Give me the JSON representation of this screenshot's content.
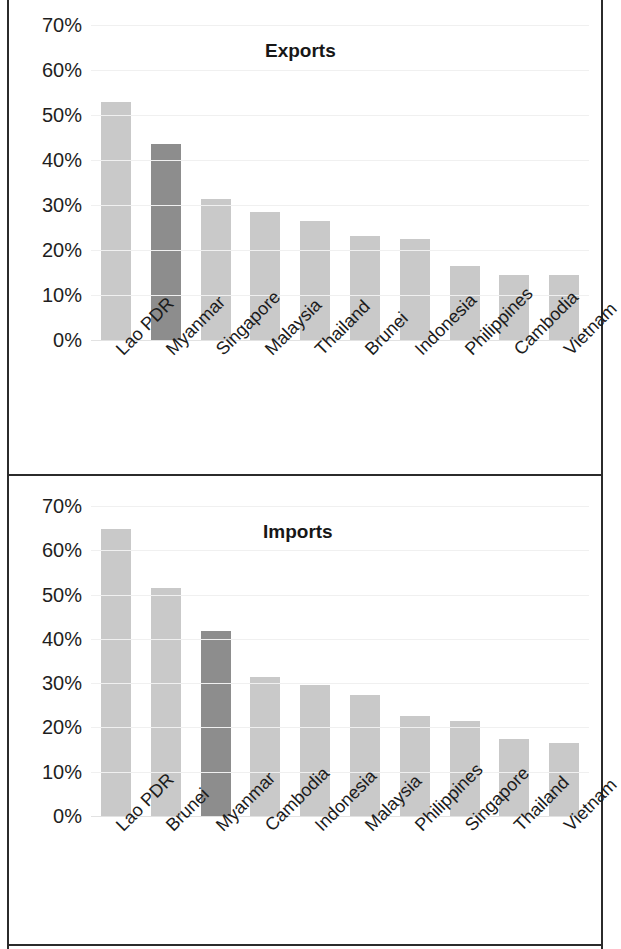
{
  "colors": {
    "bar_default": "#c9c9c9",
    "bar_highlight": "#8d8d8d",
    "frame": "#2b2b2b",
    "text": "#1b1b1b",
    "gridline": "#f0f0f0",
    "background": "#ffffff"
  },
  "panels": {
    "exports": {
      "title": "Exports"
    },
    "imports": {
      "title": "Imports"
    }
  },
  "axis": {
    "ticks": [
      "70%",
      "60%",
      "50%",
      "40%",
      "30%",
      "20%",
      "10%",
      "0%"
    ],
    "tick_values": [
      70,
      60,
      50,
      40,
      30,
      20,
      10,
      0
    ]
  },
  "chart_data": [
    {
      "type": "bar",
      "title": "Exports",
      "xlabel": "",
      "ylabel": "",
      "ylim": [
        0,
        70
      ],
      "ytick_labels": [
        "0%",
        "10%",
        "20%",
        "30%",
        "40%",
        "50%",
        "60%",
        "70%"
      ],
      "grid": true,
      "legend": "none",
      "highlight_category": "Myanmar",
      "categories": [
        "Lao PDR",
        "Myanmar",
        "Singapore",
        "Malaysia",
        "Thailand",
        "Brunei",
        "Indonesia",
        "Philippines",
        "Cambodia",
        "Vietnam"
      ],
      "values": [
        53.0,
        43.5,
        31.3,
        28.4,
        26.4,
        23.2,
        22.5,
        16.4,
        14.5,
        14.4
      ],
      "value_labels": [
        "53%",
        "43.5%",
        "31.3%",
        "28.4%",
        "26.4%",
        "23.2%",
        "22.5%",
        "16.4%",
        "14.5%",
        "14.4%"
      ]
    },
    {
      "type": "bar",
      "title": "Imports",
      "xlabel": "",
      "ylabel": "",
      "ylim": [
        0,
        70
      ],
      "ytick_labels": [
        "0%",
        "10%",
        "20%",
        "30%",
        "40%",
        "50%",
        "60%",
        "70%"
      ],
      "grid": true,
      "legend": "none",
      "highlight_category": "Myanmar",
      "categories": [
        "Lao PDR",
        "Brunei",
        "Myanmar",
        "Cambodia",
        "Indonesia",
        "Malaysia",
        "Philippines",
        "Singapore",
        "Thailand",
        "Vietnam"
      ],
      "values": [
        64.8,
        51.5,
        41.8,
        31.4,
        29.6,
        27.4,
        22.5,
        21.4,
        17.4,
        16.4
      ],
      "value_labels": [
        "64.8%",
        "51.5%",
        "41.8%",
        "31.4%",
        "29.6%",
        "27.4%",
        "22.5%",
        "21.4%",
        "17.4%",
        "16.4%"
      ]
    }
  ]
}
